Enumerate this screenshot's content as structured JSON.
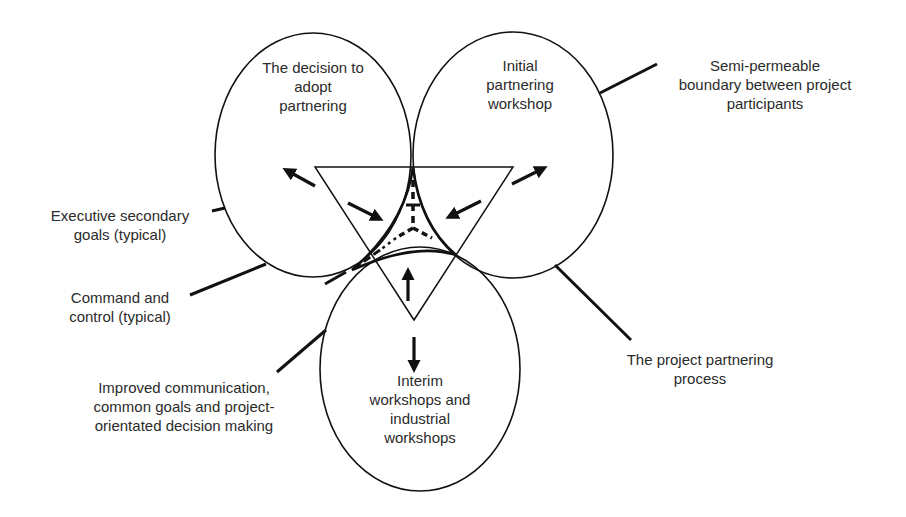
{
  "diagram": {
    "colors": {
      "stroke": "#111111",
      "text": "#2b2b2b",
      "background": "#ffffff"
    },
    "phases": [
      {
        "id": "decision",
        "label": "The decision to\nadopt\npartnering"
      },
      {
        "id": "initial",
        "label": "Initial\npartnering\nworkshop"
      },
      {
        "id": "interim",
        "label": "Interim\nworkshops and\nindustrial\nworkshops"
      }
    ],
    "callouts": {
      "semi_permeable": "Semi-permeable\nboundary between project\nparticipants",
      "executive": "Executive secondary\ngoals (typical)",
      "command": "Command and\ncontrol (typical)",
      "improved": "Improved communication,\ncommon goals and project-\norientated decision making",
      "process": "The project partnering\nprocess"
    },
    "arrows": [
      {
        "id": "to-decision",
        "direction": "outward"
      },
      {
        "id": "to-initial",
        "direction": "outward"
      },
      {
        "id": "to-interim",
        "direction": "outward"
      },
      {
        "id": "from-decision",
        "direction": "inward"
      },
      {
        "id": "from-initial",
        "direction": "inward"
      },
      {
        "id": "from-interim",
        "direction": "inward"
      }
    ]
  }
}
